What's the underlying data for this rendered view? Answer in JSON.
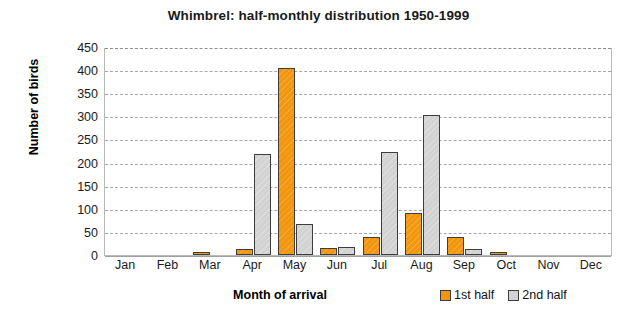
{
  "chart_data": {
    "type": "bar",
    "title": "Whimbrel: half-monthly distribution 1950-1999",
    "xlabel": "Month of arrival",
    "ylabel": "Number of birds",
    "categories": [
      "Jan",
      "Feb",
      "Mar",
      "Apr",
      "May",
      "Jun",
      "Jul",
      "Aug",
      "Sep",
      "Oct",
      "Nov",
      "Dec"
    ],
    "series": [
      {
        "name": "1st half",
        "color": "#f2960d",
        "values": [
          0,
          0,
          4,
          13,
          404,
          15,
          38,
          90,
          38,
          4,
          0,
          0
        ]
      },
      {
        "name": "2nd half",
        "color": "#d2d2d2",
        "values": [
          0,
          0,
          0,
          218,
          67,
          17,
          222,
          303,
          12,
          0,
          0,
          0
        ]
      }
    ],
    "yticks": [
      0,
      50,
      100,
      150,
      200,
      250,
      300,
      350,
      400,
      450
    ],
    "ylim": [
      0,
      450
    ],
    "grid": true,
    "legend_position": "bottom-right"
  }
}
